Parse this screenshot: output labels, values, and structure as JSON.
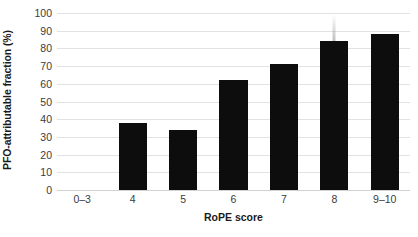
{
  "chart_data": {
    "type": "bar",
    "title": "",
    "subtitle": "",
    "xlabel": "RoPE score",
    "ylabel": "PFO-attributable fraction (%)",
    "categories": [
      "0–3",
      "4",
      "5",
      "6",
      "7",
      "8",
      "9–10"
    ],
    "values": [
      0,
      38,
      34,
      62,
      71,
      84,
      88
    ],
    "series": [
      {
        "name": "PFO-attributable fraction",
        "values": [
          0,
          38,
          34,
          62,
          71,
          84,
          88
        ]
      }
    ],
    "ylim": [
      0,
      100
    ],
    "ytick_labels": [
      "100",
      "90",
      "80",
      "70",
      "60",
      "50",
      "40",
      "30",
      "20",
      "10",
      "0"
    ],
    "ytick_values": [
      100,
      90,
      80,
      70,
      60,
      50,
      40,
      30,
      20,
      10,
      0
    ],
    "ytick_step": 10,
    "grid": true,
    "grid_axis": "y",
    "legend": false,
    "legend_position": "none",
    "bar_color": "#0d0d0d",
    "grid_color": "#e2e2e2",
    "axis_text_color": "#3b3b3b",
    "title_text_color": "#1a1a1a",
    "background_color": "#ffffff",
    "annotations": []
  }
}
